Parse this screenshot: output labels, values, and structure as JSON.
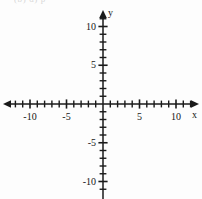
{
  "figure": {
    "clipped_header_text": "(b)  d)  p",
    "background_color": "#fdfdfd",
    "ink_color": "#1a1a1a"
  },
  "chart_data": {
    "type": "scatter",
    "title": "",
    "subtitle": "",
    "xlabel": "x",
    "ylabel": "y",
    "xlim": [
      -13,
      13
    ],
    "ylim": [
      -12,
      13
    ],
    "grid": false,
    "legend": null,
    "series": [],
    "x_tick_labels": [
      "-10",
      "-5",
      "5",
      "10"
    ],
    "x_tick_values": [
      -10,
      -5,
      5,
      10
    ],
    "y_tick_labels": [
      "10",
      "5",
      "-5",
      "-10"
    ],
    "y_tick_values": [
      10,
      5,
      -5,
      -10
    ],
    "x_minor_tick_values": [
      -12,
      -11,
      -10,
      -9,
      -8,
      -7,
      -6,
      -5,
      -4,
      -3,
      -2,
      -1,
      1,
      2,
      3,
      4,
      5,
      6,
      7,
      8,
      9,
      10,
      11,
      12
    ],
    "y_minor_tick_values": [
      -11,
      -10,
      -9,
      -8,
      -7,
      -6,
      -5,
      -4,
      -3,
      -2,
      -1,
      1,
      2,
      3,
      4,
      5,
      6,
      7,
      8,
      9,
      10,
      11
    ],
    "annotations": []
  },
  "axes": {
    "x_axis_name": "x",
    "y_axis_name": "y"
  },
  "geometry": {
    "origin_x": 103,
    "origin_y": 104,
    "unit_x": 7.3,
    "unit_y": 7.75
  }
}
